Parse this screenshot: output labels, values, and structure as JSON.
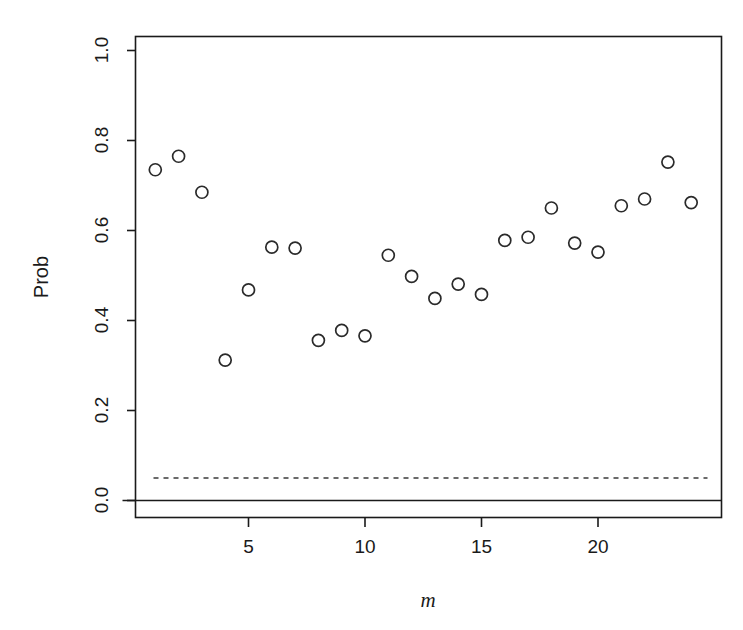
{
  "chart_data": {
    "type": "scatter",
    "title": "",
    "xlabel": "m",
    "ylabel": "Prob",
    "xlim": [
      0.3,
      24.7
    ],
    "ylim": [
      -0.03,
      1.05
    ],
    "grid": false,
    "legend": "none",
    "x_ticks": [
      5,
      10,
      15,
      20
    ],
    "x_tick_labels": [
      "5",
      "10",
      "15",
      "20"
    ],
    "y_ticks": [
      0.0,
      0.2,
      0.4,
      0.6,
      0.8,
      1.0
    ],
    "y_tick_labels": [
      "0.0",
      "0.2",
      "0.4",
      "0.6",
      "0.8",
      "1.0"
    ],
    "marker": "open-circle",
    "marker_color": "#2a2a2a",
    "x": [
      1,
      2,
      3,
      4,
      5,
      6,
      7,
      8,
      9,
      10,
      11,
      12,
      13,
      14,
      15,
      16,
      17,
      18,
      19,
      20,
      21,
      22,
      23,
      24
    ],
    "y": [
      0.735,
      0.765,
      0.685,
      0.312,
      0.468,
      0.563,
      0.561,
      0.356,
      0.378,
      0.366,
      0.545,
      0.498,
      0.449,
      0.481,
      0.458,
      0.578,
      0.585,
      0.65,
      0.572,
      0.552,
      0.655,
      0.67,
      0.752,
      0.662
    ],
    "reference_lines": [
      {
        "name": "significance-threshold",
        "y": 0.05,
        "style": "dashed",
        "color": "#3a3a3a"
      },
      {
        "name": "zero-baseline",
        "y": 0.0,
        "style": "solid",
        "color": "#1a1a1a"
      }
    ]
  },
  "labels": {
    "y_axis_title": "Prob",
    "x_axis_title": "m"
  }
}
